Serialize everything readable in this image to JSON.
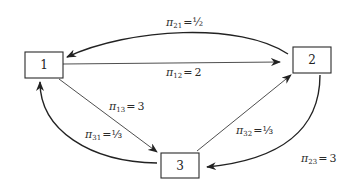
{
  "diagram": {
    "type": "state-transition-graph",
    "nodes": [
      {
        "id": "1",
        "label": "1"
      },
      {
        "id": "2",
        "label": "2"
      },
      {
        "id": "3",
        "label": "3"
      }
    ],
    "edges": [
      {
        "from": "2",
        "to": "1",
        "symbol": "π",
        "subscript": "21",
        "value": "½",
        "shape": "curved"
      },
      {
        "from": "1",
        "to": "2",
        "symbol": "π",
        "subscript": "12",
        "value": "2",
        "shape": "straight"
      },
      {
        "from": "1",
        "to": "3",
        "symbol": "π",
        "subscript": "13",
        "value": "3",
        "shape": "straight"
      },
      {
        "from": "3",
        "to": "1",
        "symbol": "π",
        "subscript": "31",
        "value": "⅓",
        "shape": "curved"
      },
      {
        "from": "3",
        "to": "2",
        "symbol": "π",
        "subscript": "32",
        "value": "⅓",
        "shape": "straight"
      },
      {
        "from": "2",
        "to": "3",
        "symbol": "π",
        "subscript": "23",
        "value": "3",
        "shape": "curved"
      }
    ],
    "equals": "="
  }
}
